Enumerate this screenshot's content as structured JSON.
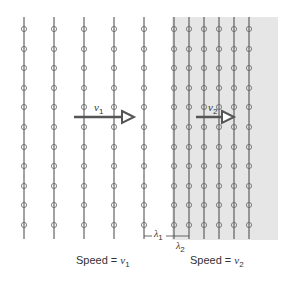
{
  "diagram": {
    "region1": {
      "speed_label": "Speed = ",
      "var": "v",
      "sub": "1",
      "arrow_var": "v",
      "arrow_sub": "1"
    },
    "region2": {
      "speed_label": "Speed = ",
      "var": "v",
      "sub": "2",
      "arrow_var": "v",
      "arrow_sub": "2",
      "shade_color": "#e6e6e6"
    },
    "wavelength1": {
      "symbol": "λ",
      "sub": "1"
    },
    "wavelength2": {
      "symbol": "λ",
      "sub": "2"
    },
    "wavefronts_region1_x": [
      24,
      54,
      84,
      114,
      144
    ],
    "wavefronts_region2_x": [
      174,
      189,
      204,
      219,
      234,
      249
    ],
    "marker_y": [
      29,
      49,
      68,
      88,
      107,
      127,
      147,
      166,
      186,
      205,
      225
    ],
    "line_color": "#444444",
    "arrow_color": "#555555"
  }
}
